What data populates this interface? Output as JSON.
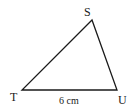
{
  "diagram": {
    "type": "triangle",
    "vertices": [
      {
        "name": "S",
        "x": 92,
        "y": 20
      },
      {
        "name": "T",
        "x": 22,
        "y": 90
      },
      {
        "name": "U",
        "x": 117,
        "y": 90
      }
    ],
    "labels": {
      "S": "S",
      "T": "T",
      "U": "U",
      "side_TU": "6 cm"
    },
    "stroke_color": "#1a1a1a"
  }
}
